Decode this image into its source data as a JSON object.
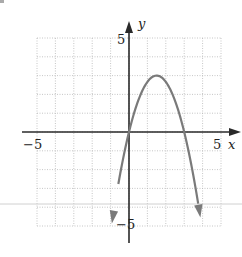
{
  "chart_data": {
    "type": "line",
    "title": "",
    "xlabel": "x",
    "ylabel": "y",
    "xlim": [
      -5,
      5
    ],
    "ylim": [
      -5,
      5
    ],
    "grid": true,
    "grid_style": "dotted",
    "tick_labels": {
      "x": [
        {
          "value": -5,
          "label": "−5"
        },
        {
          "value": 5,
          "label": "5"
        }
      ],
      "y": [
        {
          "value": 5,
          "label": "5"
        },
        {
          "value": -5,
          "label": "−5"
        }
      ]
    },
    "series": [
      {
        "name": "parabola",
        "equation": "y = 4x - (4/3)x^2",
        "vertex": [
          1.5,
          3
        ],
        "x_intercepts": [
          0,
          3
        ],
        "domain_shown": [
          -0.93,
          3.88
        ],
        "arrows_at_ends": true,
        "x": [
          -0.93,
          -0.5,
          0,
          0.5,
          1,
          1.5,
          2,
          2.5,
          3,
          3.5,
          3.88
        ],
        "y": [
          -4.87,
          -2.33,
          0,
          1.67,
          2.67,
          3,
          2.67,
          1.67,
          0,
          -2.33,
          -4.55
        ]
      }
    ]
  },
  "colors": {
    "axis": "#2a2a2a",
    "curve": "#7a7a7a",
    "grid": "#b8b8b8",
    "scan_line": "#d0d0d0"
  }
}
